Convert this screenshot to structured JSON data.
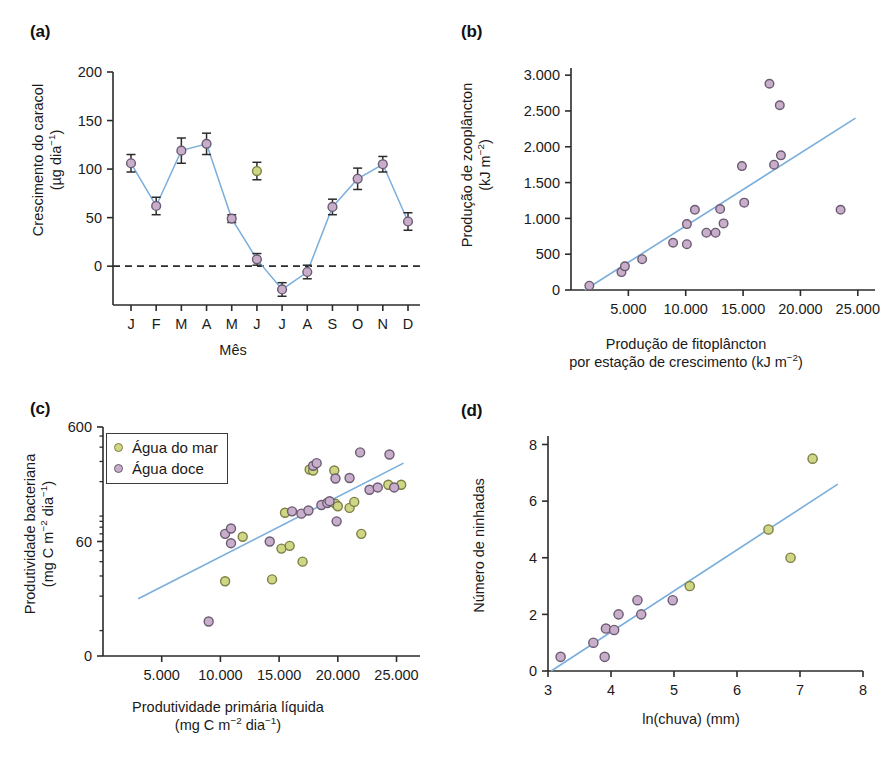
{
  "figure": {
    "panel_labels": {
      "a": "(a)",
      "b": "(b)",
      "c": "(c)",
      "d": "(d)"
    },
    "colors": {
      "freshwater_marker_fill": "#c9aecb",
      "seawater_marker_fill": "#cfd785",
      "marker_edge": "#6b5b72",
      "seawater_marker_edge": "#7d7f46",
      "trend_line": "#7aaedc",
      "series_line": "#7aaedc",
      "axis": "#2b2b2b",
      "zero_line": "#2b2b2b"
    }
  },
  "panel_a": {
    "label": "(a)",
    "chart_data": {
      "type": "line",
      "title": "",
      "xlabel": "Mês",
      "ylabel": "Crescimento do caracol (µg dia⁻¹)",
      "ylabel_line1": "Crescimento do caracol",
      "ylabel_line2": "(µg dia⁻¹)",
      "categories": [
        "J",
        "F",
        "M",
        "A",
        "M",
        "J",
        "J",
        "A",
        "S",
        "O",
        "N",
        "D"
      ],
      "xtick_labels": [
        "J",
        "F",
        "M",
        "A",
        "M",
        "J",
        "J",
        "A",
        "S",
        "O",
        "N",
        "D"
      ],
      "ytick_labels": [
        "0",
        "50",
        "100",
        "150",
        "200"
      ],
      "yticks": [
        0,
        50,
        100,
        150,
        200
      ],
      "ylim": [
        -40,
        200
      ],
      "grid": false,
      "zero_reference_line": 0,
      "zero_line_style": "dashed",
      "legend_position": "none",
      "series": [
        {
          "name": "Crescimento do caracol",
          "connected": true,
          "marker_color": "#c9aecb",
          "values": [
            106,
            62,
            119,
            126,
            49,
            7,
            -24,
            -6,
            61,
            90,
            105,
            46
          ],
          "errors": [
            9,
            9,
            13,
            11,
            4,
            6,
            7,
            7,
            8,
            11,
            8,
            9
          ]
        },
        {
          "name": "Ponto isolado (J)",
          "connected": false,
          "marker_color": "#cfd785",
          "points": [
            {
              "category": "J",
              "x_index": 5,
              "value": 98,
              "error": 9
            }
          ]
        }
      ]
    }
  },
  "panel_b": {
    "label": "(b)",
    "chart_data": {
      "type": "scatter",
      "title": "",
      "xlabel": "Produção de fitoplâncton por estação de crescimento (kJ m⁻²)",
      "xlabel_line1": "Produção de fitoplâncton",
      "xlabel_line2": "por estação de crescimento (kJ m⁻²)",
      "ylabel": "Produção de zooplâncton (kJ m⁻²)",
      "ylabel_line1": "Produção de zooplâncton",
      "ylabel_line2": "(kJ m⁻²)",
      "xtick_labels": [
        "5.000",
        "10.000",
        "15.000",
        "20.000",
        "25.000"
      ],
      "xticks": [
        5000,
        10000,
        15000,
        20000,
        25000
      ],
      "ytick_labels": [
        "0",
        "500",
        "1.000",
        "1.500",
        "2.000",
        "2.500",
        "3.000"
      ],
      "yticks": [
        0,
        500,
        1000,
        1500,
        2000,
        2500,
        3000
      ],
      "xlim": [
        0,
        26500
      ],
      "ylim": [
        0,
        3100
      ],
      "grid": false,
      "legend_position": "none",
      "marker_color": "#c9aecb",
      "points": [
        {
          "x": 1600,
          "y": 60
        },
        {
          "x": 4400,
          "y": 250
        },
        {
          "x": 4700,
          "y": 330
        },
        {
          "x": 6200,
          "y": 430
        },
        {
          "x": 8900,
          "y": 660
        },
        {
          "x": 10100,
          "y": 640
        },
        {
          "x": 10100,
          "y": 920
        },
        {
          "x": 10800,
          "y": 1120
        },
        {
          "x": 11800,
          "y": 800
        },
        {
          "x": 12600,
          "y": 800
        },
        {
          "x": 13000,
          "y": 1130
        },
        {
          "x": 13300,
          "y": 930
        },
        {
          "x": 14900,
          "y": 1730
        },
        {
          "x": 15100,
          "y": 1220
        },
        {
          "x": 17300,
          "y": 2880
        },
        {
          "x": 17700,
          "y": 1750
        },
        {
          "x": 18200,
          "y": 2580
        },
        {
          "x": 18300,
          "y": 1880
        },
        {
          "x": 23500,
          "y": 1120
        }
      ],
      "trend_line": {
        "x1": 1200,
        "y1": 0,
        "x2": 24800,
        "y2": 2400
      }
    }
  },
  "panel_c": {
    "label": "(c)",
    "chart_data": {
      "type": "scatter",
      "title": "",
      "xlabel": "Produtividade primária líquida (mg C m⁻² dia⁻¹)",
      "xlabel_line1": "Produtividade primária líquida",
      "xlabel_line2": "(mg C m⁻² dia⁻¹)",
      "ylabel": "Produtividade bacteriana (mg C m⁻² dia⁻¹)",
      "ylabel_line1": "Produtividade bacteriana",
      "ylabel_line2": "(mg C m⁻² dia⁻¹)",
      "yscale": "log",
      "xtick_labels": [
        "5.000",
        "10.000",
        "15.000",
        "20.000",
        "25.000"
      ],
      "xticks": [
        5000,
        10000,
        15000,
        20000,
        25000
      ],
      "ytick_labels": [
        "0",
        "60",
        "600"
      ],
      "yticks": [
        6,
        60,
        600
      ],
      "xlim": [
        0,
        27000
      ],
      "ylim": [
        6,
        600
      ],
      "grid": false,
      "legend_position": "upper-left",
      "legend": [
        {
          "label": "Água do mar",
          "color": "#cfd785"
        },
        {
          "label": "Água doce",
          "color": "#c9aecb"
        }
      ],
      "series": [
        {
          "name": "Água do mar",
          "marker_color": "#cfd785",
          "points": [
            {
              "x": 10400,
              "y": 27
            },
            {
              "x": 11900,
              "y": 66
            },
            {
              "x": 14400,
              "y": 28
            },
            {
              "x": 15200,
              "y": 52
            },
            {
              "x": 15500,
              "y": 107
            },
            {
              "x": 15900,
              "y": 55
            },
            {
              "x": 17000,
              "y": 40
            },
            {
              "x": 17600,
              "y": 255
            },
            {
              "x": 17900,
              "y": 250
            },
            {
              "x": 19700,
              "y": 250
            },
            {
              "x": 19800,
              "y": 128
            },
            {
              "x": 20000,
              "y": 122
            },
            {
              "x": 21000,
              "y": 118
            },
            {
              "x": 21400,
              "y": 133
            },
            {
              "x": 22000,
              "y": 70
            },
            {
              "x": 24300,
              "y": 188
            },
            {
              "x": 25400,
              "y": 188
            }
          ]
        },
        {
          "name": "Água doce",
          "marker_color": "#c9aecb",
          "points": [
            {
              "x": 9000,
              "y": 12
            },
            {
              "x": 10400,
              "y": 70
            },
            {
              "x": 10900,
              "y": 78
            },
            {
              "x": 10900,
              "y": 58
            },
            {
              "x": 14200,
              "y": 60
            },
            {
              "x": 16100,
              "y": 110
            },
            {
              "x": 16900,
              "y": 105
            },
            {
              "x": 17500,
              "y": 112
            },
            {
              "x": 17900,
              "y": 275
            },
            {
              "x": 18200,
              "y": 290
            },
            {
              "x": 18600,
              "y": 125
            },
            {
              "x": 19100,
              "y": 130
            },
            {
              "x": 19300,
              "y": 135
            },
            {
              "x": 19800,
              "y": 213
            },
            {
              "x": 19900,
              "y": 90
            },
            {
              "x": 21000,
              "y": 215
            },
            {
              "x": 21900,
              "y": 360
            },
            {
              "x": 22700,
              "y": 170
            },
            {
              "x": 23400,
              "y": 178
            },
            {
              "x": 24400,
              "y": 345
            },
            {
              "x": 24800,
              "y": 178
            }
          ]
        }
      ],
      "trend_line": {
        "x1": 3000,
        "y1": 19,
        "x2": 25600,
        "y2": 290
      }
    }
  },
  "panel_d": {
    "label": "(d)",
    "chart_data": {
      "type": "scatter",
      "title": "",
      "xlabel": "ln(chuva) (mm)",
      "ylabel": "Número de ninhadas",
      "xtick_labels": [
        "3",
        "4",
        "5",
        "6",
        "7",
        "8"
      ],
      "xticks": [
        3,
        4,
        5,
        6,
        7,
        8
      ],
      "ytick_labels": [
        "0",
        "2",
        "4",
        "6",
        "8"
      ],
      "yticks": [
        0,
        2,
        4,
        6,
        8
      ],
      "xlim": [
        3,
        8
      ],
      "ylim": [
        0,
        8.3
      ],
      "grid": false,
      "legend_position": "none",
      "series": [
        {
          "name": "Água do mar",
          "marker_color": "#cfd785",
          "points": [
            {
              "x": 5.25,
              "y": 3.0
            },
            {
              "x": 6.5,
              "y": 5.0
            },
            {
              "x": 6.85,
              "y": 4.0
            },
            {
              "x": 7.2,
              "y": 7.5
            }
          ]
        },
        {
          "name": "Água doce",
          "marker_color": "#c9aecb",
          "points": [
            {
              "x": 3.2,
              "y": 0.5
            },
            {
              "x": 3.72,
              "y": 1.0
            },
            {
              "x": 3.9,
              "y": 0.5
            },
            {
              "x": 3.92,
              "y": 1.5
            },
            {
              "x": 4.05,
              "y": 1.45
            },
            {
              "x": 4.12,
              "y": 2.0
            },
            {
              "x": 4.42,
              "y": 2.5
            },
            {
              "x": 4.48,
              "y": 2.0
            },
            {
              "x": 4.98,
              "y": 2.5
            }
          ]
        }
      ],
      "trend_line": {
        "x1": 3.05,
        "y1": 0.0,
        "x2": 7.6,
        "y2": 6.6
      }
    }
  }
}
